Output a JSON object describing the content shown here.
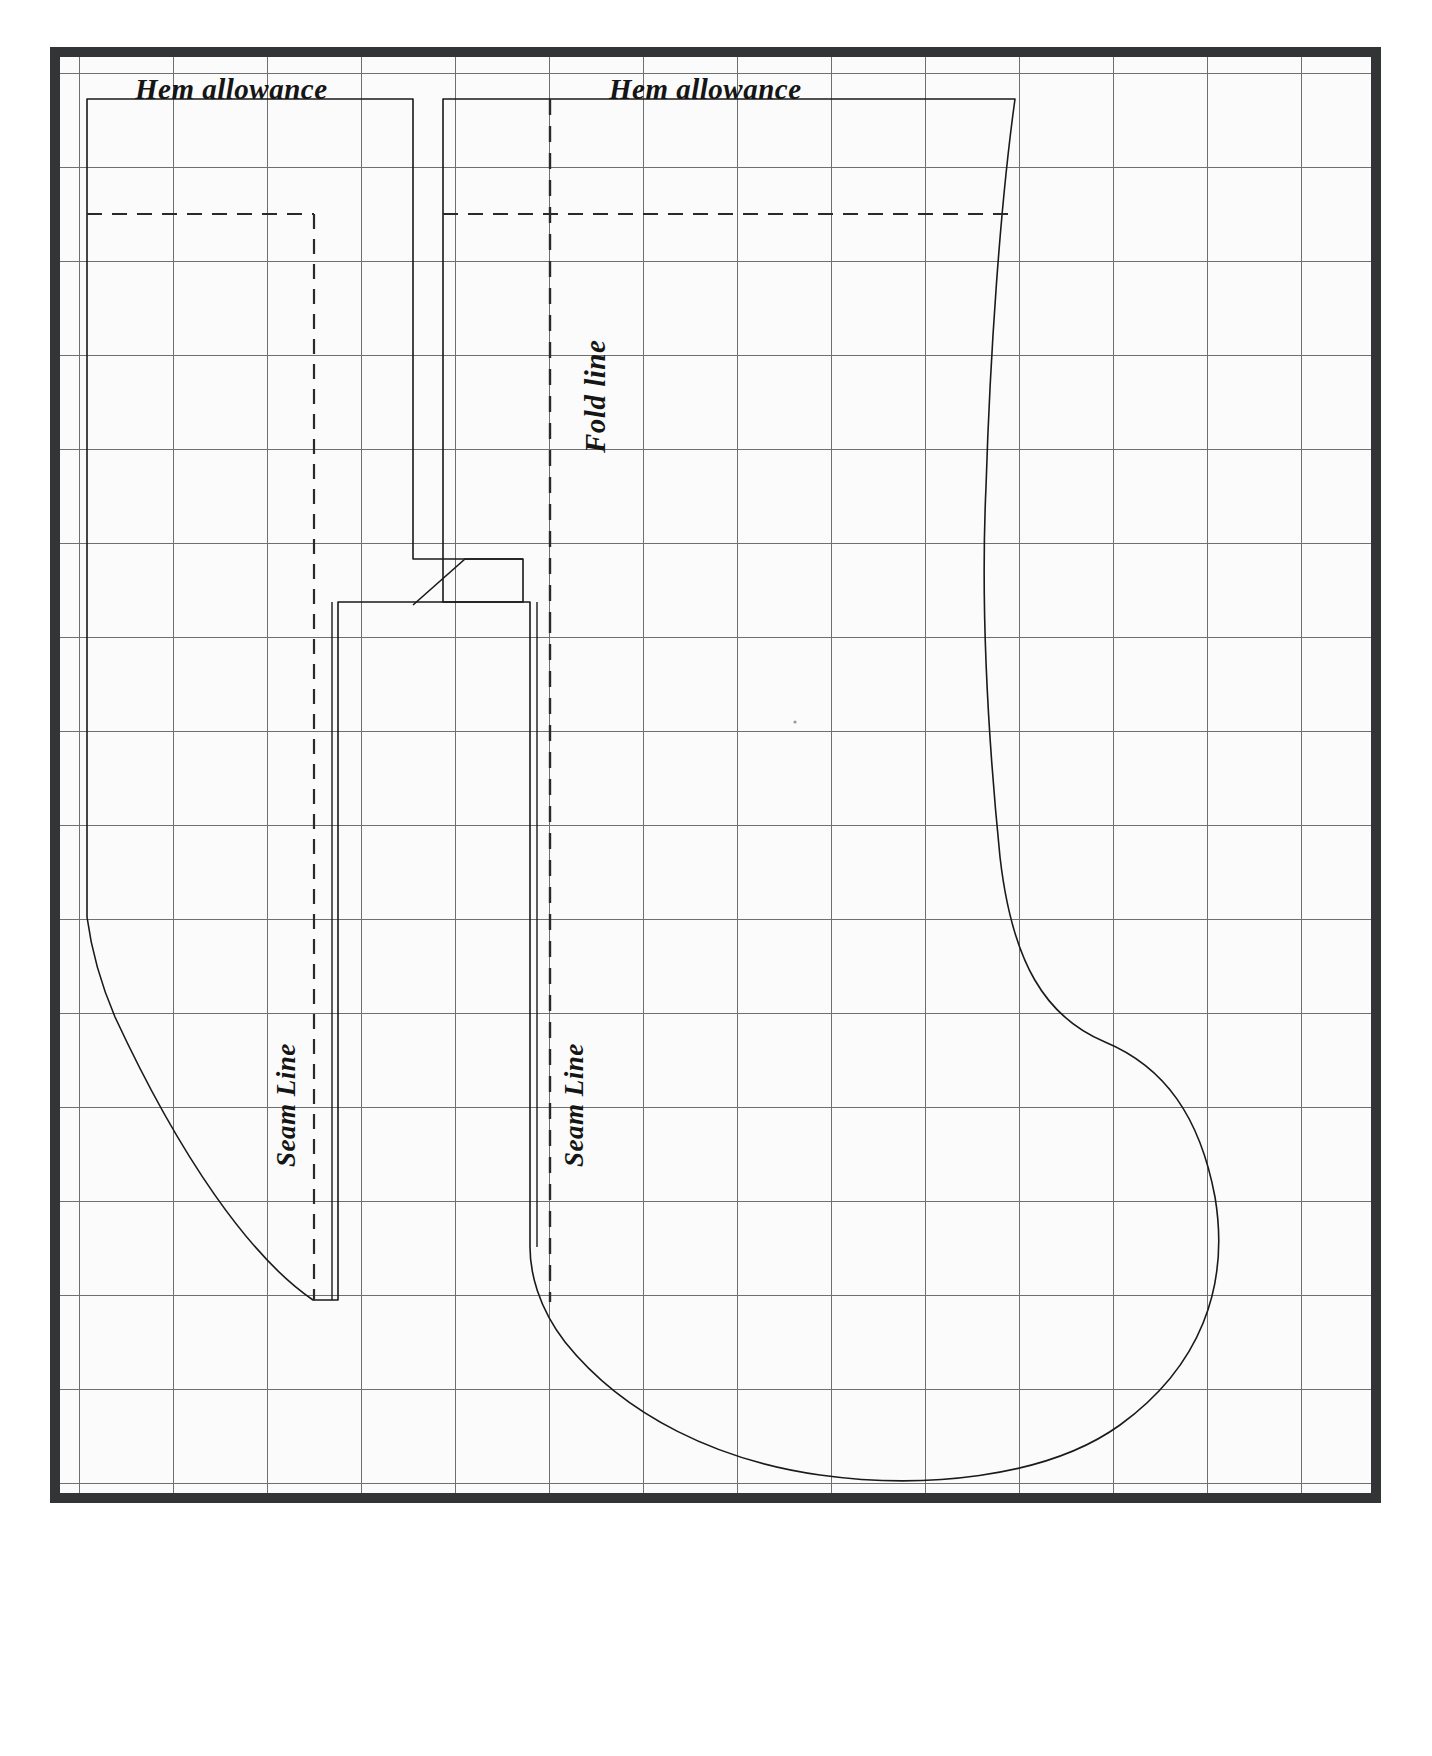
{
  "document": {
    "type": "sewing-pattern-template",
    "title": "Christmas stocking pattern on grid",
    "page_width": 1432,
    "page_height": 1756
  },
  "colors": {
    "frame": "#333436",
    "paper": "#fbfbfb",
    "grid_line": "#6f6f6f",
    "pattern_line": "#1a1a1a",
    "text": "#151515"
  },
  "grid": {
    "spacing_px": 94,
    "visible": true,
    "line_width": 1
  },
  "labels": {
    "hem_allowance_left": "Hem allowance",
    "hem_allowance_right": "Hem allowance",
    "fold_line": "Fold line",
    "seam_line_left": "Seam Line",
    "seam_line_right": "Seam Line"
  },
  "line_styles": {
    "cut_line": "solid",
    "seam_line": "dashed",
    "fold_line": "dashed",
    "hem_line": "dashed"
  },
  "pieces": [
    {
      "name": "stocking-cuff-left",
      "description": "Left cuff / facing rectangle piece with seam and hem allowance"
    },
    {
      "name": "stocking-body-right",
      "description": "Main stocking body with leg, heel and toe curves, fold line at centre"
    }
  ]
}
